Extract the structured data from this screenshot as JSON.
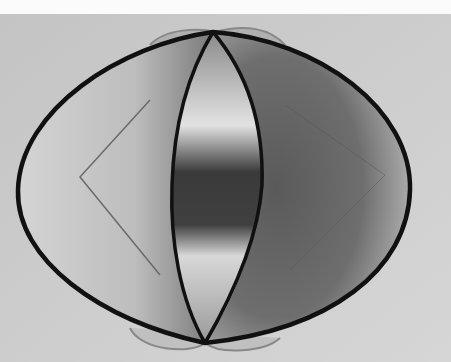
{
  "image": {
    "subject": "wire frame of three intersecting elliptical rings with translucent film surfaces",
    "style": "black-and-white photograph",
    "colors": {
      "background": "#cfcfcf",
      "top_band": "#fbfbfb",
      "wire": "#111111",
      "film_light": "#d8d8d8",
      "film_dark": "#3a3a3a"
    }
  }
}
